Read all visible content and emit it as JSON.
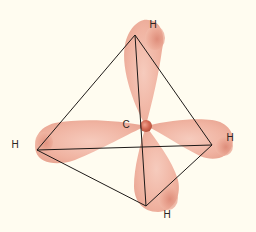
{
  "diagram": {
    "colors": {
      "background": "#fffcf0",
      "orbital": "#f2b9a8",
      "orbital_dark": "#d9826f",
      "nucleus": "#d46a55",
      "edge": "#1e1a18",
      "label": "#2a2522"
    },
    "center_atom": {
      "label": "C",
      "x": 146,
      "y": 126
    },
    "hydrogens": [
      {
        "id": "top",
        "label": "H",
        "vertex": [
          135,
          35
        ],
        "label_pos": [
          153,
          25
        ]
      },
      {
        "id": "left",
        "label": "H",
        "vertex": [
          37,
          150
        ],
        "label_pos": [
          15,
          145
        ]
      },
      {
        "id": "right",
        "label": "H",
        "vertex": [
          212,
          145
        ],
        "label_pos": [
          230,
          138
        ]
      },
      {
        "id": "bottom",
        "label": "H",
        "vertex": [
          146,
          206
        ],
        "label_pos": [
          167,
          215
        ]
      }
    ],
    "edges": [
      [
        "top",
        "left"
      ],
      [
        "top",
        "right"
      ],
      [
        "top",
        "bottom"
      ],
      [
        "left",
        "right"
      ],
      [
        "left",
        "bottom"
      ],
      [
        "right",
        "bottom"
      ]
    ]
  }
}
